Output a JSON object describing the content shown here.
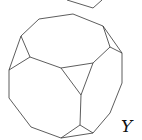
{
  "figure": {
    "stroke_color": "#333333",
    "background": "#ffffff",
    "label": {
      "text": "Y",
      "x": 121,
      "y": 118
    },
    "partial_top_shape": [
      [
        67,
        0
      ],
      [
        93,
        8
      ],
      [
        102,
        0
      ]
    ],
    "outline": [
      [
        39,
        19
      ],
      [
        73,
        14
      ],
      [
        103,
        26
      ],
      [
        122,
        53
      ],
      [
        122,
        83
      ],
      [
        110,
        113
      ],
      [
        93,
        133
      ],
      [
        61,
        138
      ],
      [
        31,
        127
      ],
      [
        9,
        98
      ],
      [
        9,
        70
      ],
      [
        21,
        36
      ]
    ],
    "inner_edges": [
      [
        [
          21,
          36
        ],
        [
          30,
          57
        ]
      ],
      [
        [
          9,
          70
        ],
        [
          30,
          57
        ]
      ],
      [
        [
          30,
          57
        ],
        [
          61,
          68
        ]
      ],
      [
        [
          61,
          68
        ],
        [
          93,
          63
        ]
      ],
      [
        [
          93,
          63
        ],
        [
          110,
          47
        ]
      ],
      [
        [
          103,
          26
        ],
        [
          110,
          47
        ]
      ],
      [
        [
          110,
          47
        ],
        [
          122,
          53
        ]
      ],
      [
        [
          61,
          68
        ],
        [
          81,
          95
        ]
      ],
      [
        [
          93,
          63
        ],
        [
          81,
          95
        ]
      ],
      [
        [
          81,
          95
        ],
        [
          80,
          125
        ]
      ],
      [
        [
          80,
          125
        ],
        [
          61,
          138
        ]
      ],
      [
        [
          80,
          125
        ],
        [
          93,
          133
        ]
      ]
    ]
  }
}
